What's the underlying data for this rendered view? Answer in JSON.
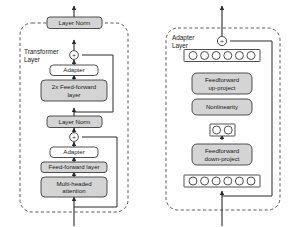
{
  "figure": {
    "colors": {
      "box_fill": "#d4d4d4",
      "box_stroke": "#3c3c3c",
      "container_stroke": "#4a4a4a",
      "line": "#2b2b2b",
      "neuron_fill": "#ffffff",
      "neuron_stroke": "#3c3c3c",
      "background": "#ffffff"
    }
  },
  "left_panel": {
    "container_label": "Transformer\nLayer",
    "container_label_line1": "Transformer",
    "container_label_line2": "Layer",
    "blocks": [
      {
        "id": "layer-norm-top",
        "label": "Layer Norm",
        "filled": true
      },
      {
        "id": "add-top",
        "label": "+",
        "shape": "circle"
      },
      {
        "id": "adapter-top",
        "label": "Adapter",
        "filled": false
      },
      {
        "id": "feed-forward-2x",
        "label": "2x Feed-forward\nlayer",
        "label_line1": "2x Feed-forward",
        "label_line2": "layer",
        "filled": true
      },
      {
        "id": "layer-norm-bottom",
        "label": "Layer Norm",
        "filled": true
      },
      {
        "id": "add-bottom",
        "label": "+",
        "shape": "circle"
      },
      {
        "id": "adapter-bottom",
        "label": "Adapter",
        "filled": false
      },
      {
        "id": "feed-forward-layer",
        "label": "Feed-forward layer",
        "filled": true
      },
      {
        "id": "multi-headed-attention",
        "label": "Multi-headed\nattention",
        "label_line1": "Multi-headed",
        "label_line2": "attention",
        "filled": true
      }
    ]
  },
  "right_panel": {
    "container_label_line1": "Adapter",
    "container_label_line2": "Layer",
    "blocks": [
      {
        "id": "add-node",
        "label": "+",
        "shape": "circle"
      },
      {
        "id": "neurons-output",
        "label": "output neurons",
        "count": 6
      },
      {
        "id": "feedforward-up-project",
        "label": "Feedforward\nup-project",
        "label_line1": "Feedforward",
        "label_line2": "up-project",
        "filled": true
      },
      {
        "id": "nonlinearity",
        "label": "Nonlinearity",
        "filled": true
      },
      {
        "id": "neurons-bottleneck",
        "label": "bottleneck neurons",
        "count": 2
      },
      {
        "id": "feedforward-down-project",
        "label": "Feedforward\ndown-project",
        "label_line1": "Feedforward",
        "label_line2": "down-project",
        "filled": true
      },
      {
        "id": "neurons-input",
        "label": "input neurons",
        "count": 6
      }
    ]
  }
}
